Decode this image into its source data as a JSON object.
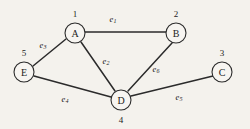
{
  "figure": {
    "background_color": "#f4f2ed",
    "ink_color": "#2b2b2b",
    "node_fill_color": "#f7f5f1"
  },
  "graph": {
    "type": "undirected-graph",
    "node_count": 5,
    "edge_count": 6,
    "nodes": [
      {
        "letter": "A",
        "number": "1",
        "cx": 75,
        "cy": 33,
        "r": 10,
        "number_x": 75,
        "number_y": 14
      },
      {
        "letter": "B",
        "number": "2",
        "cx": 176,
        "cy": 33,
        "r": 10,
        "number_x": 176,
        "number_y": 14
      },
      {
        "letter": "C",
        "number": "3",
        "cx": 222,
        "cy": 72,
        "r": 10,
        "number_x": 222,
        "number_y": 53
      },
      {
        "letter": "D",
        "number": "4",
        "cx": 121,
        "cy": 100,
        "r": 10,
        "number_x": 121,
        "number_y": 120
      },
      {
        "letter": "E",
        "number": "5",
        "cx": 24,
        "cy": 72,
        "r": 10,
        "number_x": 24,
        "number_y": 53
      }
    ],
    "edges": [
      {
        "label_base": "e",
        "label_sub": "1",
        "from": "A",
        "to": "B",
        "x1": 85,
        "y1": 32,
        "x2": 166,
        "y2": 32,
        "label_x": 113,
        "label_y": 19
      },
      {
        "label_base": "e",
        "label_sub": "2",
        "from": "A",
        "to": "D",
        "x1": 81,
        "y1": 42,
        "x2": 115,
        "y2": 91,
        "label_x": 106,
        "label_y": 61
      },
      {
        "label_base": "e",
        "label_sub": "3",
        "from": "A",
        "to": "E",
        "x1": 66,
        "y1": 39,
        "x2": 33,
        "y2": 66,
        "label_x": 43,
        "label_y": 45
      },
      {
        "label_base": "e",
        "label_sub": "4",
        "from": "E",
        "to": "D",
        "x1": 34,
        "y1": 76,
        "x2": 111,
        "y2": 97,
        "label_x": 65,
        "label_y": 99
      },
      {
        "label_base": "e",
        "label_sub": "5",
        "from": "D",
        "to": "C",
        "x1": 131,
        "y1": 96,
        "x2": 213,
        "y2": 76,
        "label_x": 179,
        "label_y": 97
      },
      {
        "label_base": "e",
        "label_sub": "6",
        "from": "B",
        "to": "D",
        "x1": 172,
        "y1": 43,
        "x2": 128,
        "y2": 91,
        "label_x": 156,
        "label_y": 69
      }
    ]
  }
}
